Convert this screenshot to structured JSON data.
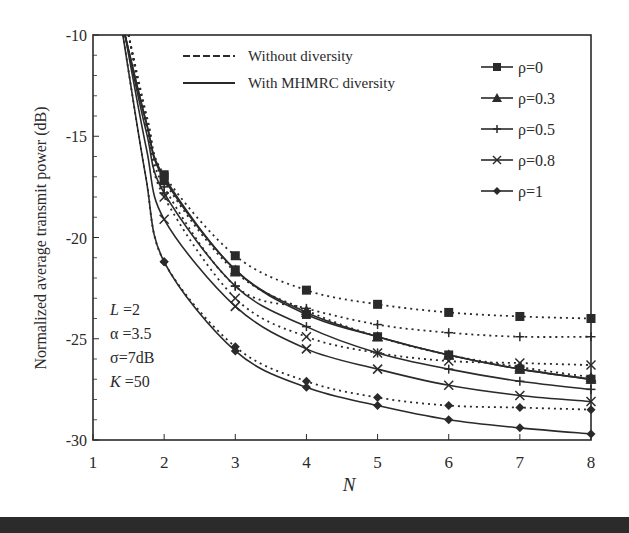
{
  "chart_data": {
    "type": "line",
    "title": "",
    "xlabel": "N",
    "ylabel": "Normalized average transmit power  (dB)",
    "xlim": [
      1,
      8
    ],
    "ylim": [
      -30,
      -10
    ],
    "x_ticks": [
      "1",
      "2",
      "3",
      "4",
      "5",
      "6",
      "7",
      "8"
    ],
    "y_ticks": [
      "-10",
      "-15",
      "-20",
      "-25",
      "-30"
    ],
    "grid": false,
    "x": [
      2,
      3,
      4,
      5,
      6,
      7,
      8
    ],
    "style_legend": [
      {
        "label": "Without diversity",
        "line": "dashed"
      },
      {
        "label": "With MHMRC diversity",
        "line": "solid"
      }
    ],
    "marker_legend": [
      {
        "label": "ρ=0",
        "marker": "square"
      },
      {
        "label": "ρ=0.3",
        "marker": "triangle"
      },
      {
        "label": "ρ=0.5",
        "marker": "plus"
      },
      {
        "label": "ρ=0.8",
        "marker": "x"
      },
      {
        "label": "ρ=1",
        "marker": "diamond"
      }
    ],
    "annotation": [
      "L =2",
      "α =3.5",
      "σ=7dB",
      "K =50"
    ],
    "series": [
      {
        "name": "ρ=0 without diversity",
        "rho": "0",
        "line": "dashed",
        "marker": "square",
        "values": [
          -16.9,
          -20.9,
          -22.6,
          -23.3,
          -23.7,
          -23.9,
          -24.0
        ]
      },
      {
        "name": "ρ=0 with MHMRC diversity",
        "rho": "0",
        "line": "solid",
        "marker": "square",
        "values": [
          -17.0,
          -21.6,
          -23.8,
          -24.9,
          -25.8,
          -26.5,
          -27.0
        ]
      },
      {
        "name": "ρ=0.3 without diversity",
        "rho": "0.3",
        "line": "dashed",
        "marker": "triangle",
        "values": [
          -17.2,
          -21.7,
          -23.6,
          -24.9,
          -25.8,
          -26.4,
          -26.9
        ]
      },
      {
        "name": "ρ=0.3 with MHMRC diversity",
        "rho": "0.3",
        "line": "solid",
        "marker": "triangle",
        "values": [
          -17.1,
          -21.6,
          -23.7,
          -24.9,
          -25.8,
          -26.5,
          -27.0
        ]
      },
      {
        "name": "ρ=0.5 without diversity",
        "rho": "0.5",
        "line": "dashed",
        "marker": "plus",
        "values": [
          -17.5,
          -22.4,
          -23.5,
          -24.3,
          -24.7,
          -24.9,
          -24.9
        ]
      },
      {
        "name": "ρ=0.5 with MHMRC diversity",
        "rho": "0.5",
        "line": "solid",
        "marker": "plus",
        "values": [
          -17.8,
          -22.4,
          -24.4,
          -25.7,
          -26.5,
          -27.1,
          -27.5
        ]
      },
      {
        "name": "ρ=0.8 without diversity",
        "rho": "0.8",
        "line": "dashed",
        "marker": "x",
        "values": [
          -18.0,
          -23.0,
          -24.9,
          -25.7,
          -26.1,
          -26.2,
          -26.3
        ]
      },
      {
        "name": "ρ=0.8 with MHMRC diversity",
        "rho": "0.8",
        "line": "solid",
        "marker": "x",
        "values": [
          -19.1,
          -23.4,
          -25.5,
          -26.5,
          -27.3,
          -27.8,
          -28.1
        ]
      },
      {
        "name": "ρ=1 without diversity",
        "rho": "1",
        "line": "dashed",
        "marker": "diamond",
        "values": [
          -21.2,
          -25.4,
          -27.1,
          -27.9,
          -28.3,
          -28.4,
          -28.5
        ]
      },
      {
        "name": "ρ=1 with MHMRC diversity",
        "rho": "1",
        "line": "solid",
        "marker": "diamond",
        "values": [
          -21.2,
          -25.6,
          -27.4,
          -28.3,
          -29.0,
          -29.4,
          -29.7
        ]
      }
    ],
    "colors": {
      "ink": "#2a2a2a",
      "background": "#ffffff",
      "bottom_band": "#2b2b2b"
    }
  }
}
